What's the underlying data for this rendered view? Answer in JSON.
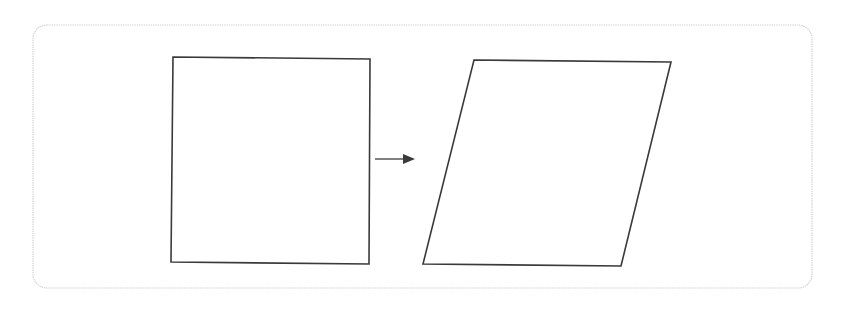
{
  "diagram": {
    "shapes": [
      {
        "id": "source",
        "kind": "square"
      },
      {
        "id": "target",
        "kind": "parallelogram"
      }
    ],
    "arrow": {
      "from": "source",
      "to": "target",
      "direction": "right"
    },
    "colors": {
      "frame_stroke": "#d4d4d4",
      "shape_stroke": "#3a3a3a",
      "arrow_stroke": "#4a4a4a",
      "background": "#ffffff"
    }
  }
}
